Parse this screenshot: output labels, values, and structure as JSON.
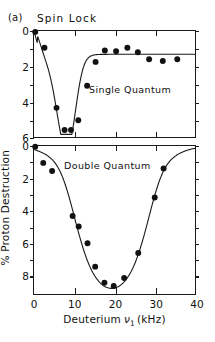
{
  "figure": {
    "panel_tag": "(a)",
    "title": "Spin Lock"
  },
  "axes": {
    "x_title_main": "Deuterium",
    "x_title_symbol": "ν",
    "x_title_sub": "1",
    "x_title_unit": "(kHz)",
    "y_title": "% Proton Destruction"
  },
  "annotations": {
    "single_quantum": "Single Quantum",
    "double_quantum": "Double Quantum"
  },
  "ticks": {
    "x": [
      "0",
      "10",
      "20",
      "30",
      "40"
    ],
    "y_top": [
      "0",
      "2",
      "4",
      "6"
    ],
    "y_bottom": [
      "0",
      "2",
      "4",
      "6",
      "8"
    ]
  },
  "colors": {
    "axis": "#1a1a1a",
    "marker": "#111111",
    "curve": "#1a1a1a",
    "background": "#ffffff"
  },
  "chart_data": [
    {
      "type": "scatter",
      "name": "Single Quantum",
      "title": "Spin Lock — Single Quantum",
      "xlabel": "Deuterium ν1 (kHz)",
      "ylabel": "% Proton Destruction",
      "xlim": [
        0,
        40
      ],
      "ylim": [
        6,
        0
      ],
      "y_inverted": true,
      "xticks": [
        0,
        10,
        20,
        30,
        40
      ],
      "yticks": [
        0,
        2,
        4,
        6
      ],
      "grid": false,
      "legend": "none",
      "points": [
        {
          "x": 0.3,
          "y": 0.05
        },
        {
          "x": 2.6,
          "y": 0.95
        },
        {
          "x": 5.6,
          "y": 4.35
        },
        {
          "x": 7.6,
          "y": 5.6
        },
        {
          "x": 9.2,
          "y": 5.6
        },
        {
          "x": 11.0,
          "y": 5.05
        },
        {
          "x": 13.2,
          "y": 3.1
        },
        {
          "x": 15.3,
          "y": 1.75
        },
        {
          "x": 17.6,
          "y": 1.1
        },
        {
          "x": 20.4,
          "y": 1.15
        },
        {
          "x": 23.2,
          "y": 0.95
        },
        {
          "x": 25.8,
          "y": 1.2
        },
        {
          "x": 28.6,
          "y": 1.6
        },
        {
          "x": 32.0,
          "y": 1.7
        },
        {
          "x": 35.6,
          "y": 1.6
        }
      ],
      "fit_curve": "sharp dip centred near 8 kHz reaching ~5.7% then recovery to plateau ~1.3%"
    },
    {
      "type": "scatter",
      "name": "Double Quantum",
      "title": "Spin Lock — Double Quantum",
      "xlabel": "Deuterium ν1 (kHz)",
      "ylabel": "% Proton Destruction",
      "xlim": [
        0,
        40
      ],
      "ylim": [
        9.2,
        0
      ],
      "y_inverted": true,
      "xticks": [
        0,
        10,
        20,
        30,
        40
      ],
      "yticks": [
        0,
        2,
        4,
        6,
        8
      ],
      "grid": false,
      "legend": "none",
      "points": [
        {
          "x": 0.3,
          "y": 0.05
        },
        {
          "x": 2.3,
          "y": 1.05
        },
        {
          "x": 4.5,
          "y": 1.55
        },
        {
          "x": 9.6,
          "y": 4.35
        },
        {
          "x": 11.1,
          "y": 5.0
        },
        {
          "x": 13.3,
          "y": 6.05
        },
        {
          "x": 15.2,
          "y": 7.5
        },
        {
          "x": 17.5,
          "y": 8.5
        },
        {
          "x": 19.8,
          "y": 8.7
        },
        {
          "x": 22.4,
          "y": 8.2
        },
        {
          "x": 25.9,
          "y": 6.65
        },
        {
          "x": 30.0,
          "y": 3.2
        },
        {
          "x": 32.2,
          "y": 1.4
        }
      ],
      "fit_curve": "broad symmetric minimum centred near 19 kHz reaching ~8.8%"
    }
  ]
}
